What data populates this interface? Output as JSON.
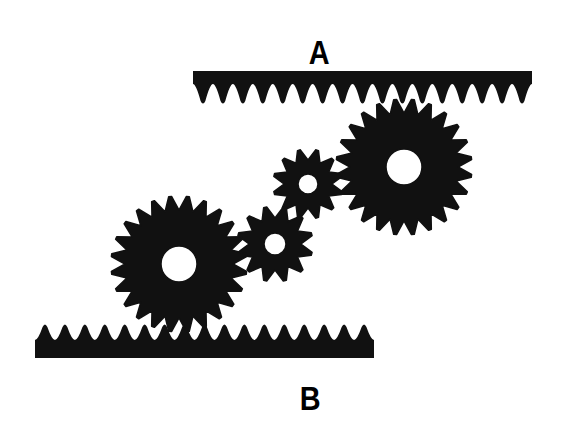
{
  "diagram": {
    "ink_color": "#111111",
    "background_color": "#ffffff",
    "labels": {
      "rack_a": "A",
      "rack_b": "B"
    },
    "racks": [
      {
        "id": "A",
        "x1": 193,
        "x2": 532,
        "bar_top": 71,
        "bar_bottom": 84,
        "tooth_tip": 104,
        "teeth": 17,
        "orientation": "teeth-down"
      },
      {
        "id": "B",
        "x1": 35,
        "x2": 374,
        "bar_top": 340,
        "bar_bottom": 358,
        "tooth_tip": 324,
        "teeth": 17,
        "orientation": "teeth-up"
      }
    ],
    "gears": [
      {
        "id": "large-upper",
        "cx": 404,
        "cy": 167,
        "r_outer": 68,
        "r_root": 54,
        "r_hole": 18,
        "teeth": 24
      },
      {
        "id": "small-upper",
        "cx": 308,
        "cy": 184,
        "r_outer": 35,
        "r_root": 24,
        "r_hole": 10,
        "teeth": 12
      },
      {
        "id": "small-lower",
        "cx": 275,
        "cy": 244,
        "r_outer": 38,
        "r_root": 26,
        "r_hole": 11,
        "teeth": 12
      },
      {
        "id": "large-lower",
        "cx": 179,
        "cy": 264,
        "r_outer": 68,
        "r_root": 54,
        "r_hole": 18,
        "teeth": 24
      }
    ]
  }
}
